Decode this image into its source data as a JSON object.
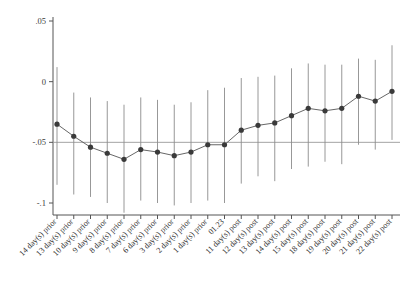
{
  "chart_data": {
    "type": "scatter",
    "title": "",
    "subtitle": "",
    "xlabel": "",
    "ylabel": "",
    "grid": false,
    "legend": "none",
    "ylim": [
      -0.1,
      0.05
    ],
    "ytick_values": [
      0.05,
      0,
      -0.05,
      -0.1
    ],
    "ytick_labels": [
      ".05",
      "0",
      "-.05",
      "-.1"
    ],
    "reference_line_y": -0.05,
    "marker_style": "filled-circle",
    "errorbar_style": "vertical-line-no-caps",
    "categories": [
      "14 day(s) prior",
      "13 day(s) prior",
      "10 day(s) prior",
      "9 day(s) prior",
      "8 day(s) prior",
      "7 day(s) prior",
      "6 day(s) prior",
      "3 day(s) prior",
      "2 day(s) prior",
      "1 day(s) prior",
      "01.23",
      "11 day(s) post",
      "12 day(s) post",
      "13 day(s) post",
      "14 day(s) post",
      "15 day(s) post",
      "18 day(s) post",
      "19 day(s) post",
      "20 day(s) post",
      "21 day(s) post",
      "22 day(s) post"
    ],
    "values": [
      -0.035,
      -0.045,
      -0.054,
      -0.059,
      -0.064,
      -0.056,
      -0.058,
      -0.061,
      -0.058,
      -0.052,
      -0.052,
      -0.04,
      -0.036,
      -0.034,
      -0.028,
      -0.022,
      -0.024,
      -0.022,
      -0.012,
      -0.016,
      -0.008
    ],
    "ci_low": [
      -0.085,
      -0.093,
      -0.095,
      -0.1,
      -0.108,
      -0.098,
      -0.1,
      -0.102,
      -0.1,
      -0.098,
      -0.1,
      -0.084,
      -0.078,
      -0.082,
      -0.072,
      -0.07,
      -0.066,
      -0.068,
      -0.052,
      -0.056,
      -0.048
    ],
    "ci_high": [
      0.012,
      -0.009,
      -0.013,
      -0.016,
      -0.019,
      -0.013,
      -0.015,
      -0.019,
      -0.017,
      -0.007,
      -0.005,
      0.003,
      0.004,
      0.005,
      0.011,
      0.015,
      0.014,
      0.014,
      0.019,
      0.018,
      0.03
    ],
    "colors": {
      "marker": "#3a3a3a",
      "errorbar": "#8c8c8c",
      "line": "#555555",
      "axis": "#555555",
      "reference": "#9a9a9a",
      "background": "#ffffff"
    }
  }
}
